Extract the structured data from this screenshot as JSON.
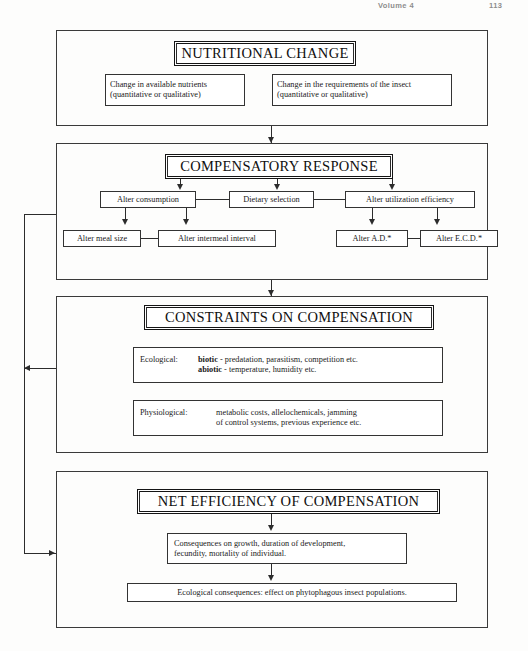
{
  "page": {
    "running_head_left": "Volume 4",
    "running_head_right": "113"
  },
  "diagram": {
    "type": "flowchart",
    "stages": [
      {
        "id": "nutritional-change",
        "heading": "NUTRITIONAL CHANGE",
        "boxes": [
          {
            "id": "available-nutrients",
            "line1": "Change in available nutrients",
            "line2": "(quantitative or qualitative)"
          },
          {
            "id": "insect-requirements",
            "line1": "Change in the requirements of the insect",
            "line2": "(quantitative or qualitative)"
          }
        ]
      },
      {
        "id": "compensatory-response",
        "heading": "COMPENSATORY RESPONSE",
        "boxes": [
          {
            "id": "alter-consumption",
            "label": "Alter consumption"
          },
          {
            "id": "dietary-selection",
            "label": "Dietary selection"
          },
          {
            "id": "alter-utilization-efficiency",
            "label": "Alter utilization efficiency"
          },
          {
            "id": "alter-meal-size",
            "label": "Alter meal size"
          },
          {
            "id": "alter-intermeal-interval",
            "label": "Alter intermeal interval"
          },
          {
            "id": "alter-ad",
            "label": "Alter A.D.*"
          },
          {
            "id": "alter-ecd",
            "label": "Alter E.C.D.*"
          }
        ]
      },
      {
        "id": "constraints-on-compensation",
        "heading": "CONSTRAINTS ON COMPENSATION",
        "boxes": [
          {
            "id": "ecological-constraints",
            "category": "Ecological:",
            "rows": [
              {
                "term": "biotic",
                "dash": "-",
                "text": "predatation, parasitism, competition etc."
              },
              {
                "term": "abiotic",
                "dash": "-",
                "text": "temperature, humidity etc."
              }
            ]
          },
          {
            "id": "physiological-constraints",
            "category": "Physiological:",
            "line1": "metabolic costs, allelochemicals, jamming",
            "line2": "of control systems, previous experience etc."
          }
        ]
      },
      {
        "id": "net-efficiency-of-compensation",
        "heading": "NET EFFICIENCY OF COMPENSATION",
        "boxes": [
          {
            "id": "consequences-individual",
            "line1": "Consequences on growth, duration of development,",
            "line2": "fecundity, mortality of individual."
          },
          {
            "id": "ecological-consequences",
            "line1": "Ecological consequences: effect on phytophagous insect populations."
          }
        ]
      }
    ]
  },
  "colors": {
    "ink": "#2c2c2c",
    "heading_ink": "#101010",
    "paper": "#fdfdfc",
    "rule": "#333333"
  }
}
